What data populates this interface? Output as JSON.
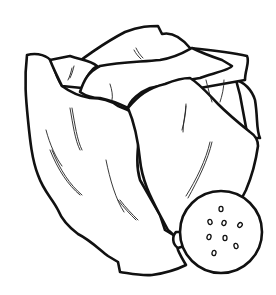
{
  "image": {
    "subject": "Lettuce head with a cut slice",
    "style": "black-and-white line-art coloring page",
    "colors": {
      "background": "#ffffff",
      "line": "#111111"
    },
    "elements": [
      "lettuce-head",
      "outer-leaves",
      "inner-leaves",
      "leaf-veins",
      "lettuce-slice",
      "slice-seeds"
    ],
    "seed_count": 9
  }
}
